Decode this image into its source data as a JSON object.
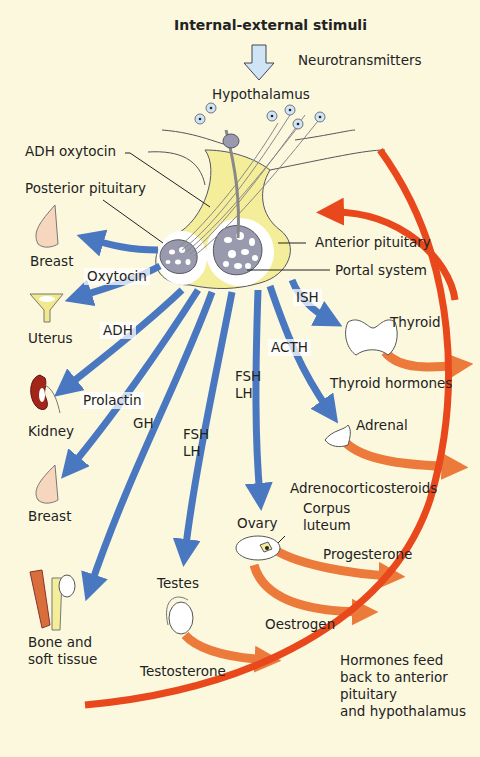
{
  "title": "Internal-external stimuli",
  "colors": {
    "background": "#fbf8de",
    "pituitary_yellow": "#f4ee9a",
    "blue_arrow": "#4a78c0",
    "orange_arrow": "#ec7a3a",
    "feedback_red": "#e8481c",
    "gland_grey": "#9a9aae",
    "neuron_blue": "#cfe4f4"
  },
  "labels": {
    "neurotransmitters": "Neurotransmitters",
    "hypothalamus": "Hypothalamus",
    "adh_oxytocin": "ADH oxytocin",
    "posterior_pituitary": "Posterior pituitary",
    "anterior_pituitary": "Anterior pituitary",
    "portal_system": "Portal system"
  },
  "targets": {
    "breast_top": "Breast",
    "uterus": "Uterus",
    "kidney": "Kidney",
    "breast_bottom": "Breast",
    "bone_soft_tissue": "Bone and\nsoft tissue",
    "testes": "Testes",
    "ovary": "Ovary",
    "corpus_luteum": "Corpus\nluteum",
    "adrenal": "Adrenal",
    "thyroid": "Thyroid"
  },
  "pituitary_hormones": {
    "oxytocin": "Oxytocin",
    "adh": "ADH",
    "prolactin": "Prolactin",
    "gh": "GH",
    "fsh_lh_left": "FSH\nLH",
    "fsh_lh_right": "FSH\nLH",
    "acth": "ACTH",
    "tsh": "ISH"
  },
  "target_hormones": {
    "thyroid_hormones": "Thyroid hormones",
    "adrenocorticosteroids": "Adrenocorticosteroids",
    "progesterone": "Progesterone",
    "oestrogen": "Oestrogen",
    "testosterone": "Testosterone"
  },
  "feedback_note": "Hormones feed\nback to anterior\npituitary\nand hypothalamus"
}
